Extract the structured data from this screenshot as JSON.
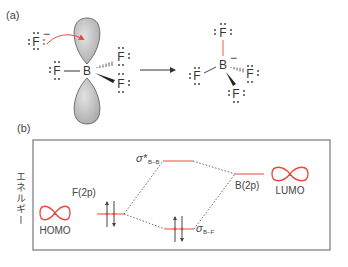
{
  "panel_a": {
    "label": "(a)",
    "reactant": {
      "central_atom": "B",
      "ligands": [
        "F",
        "F",
        "F"
      ],
      "nucleophile": "F",
      "nucleophile_charge": "−"
    },
    "product": {
      "central_atom": "B",
      "central_charge": "−",
      "ligands": [
        "F",
        "F",
        "F",
        "F"
      ]
    }
  },
  "panel_b": {
    "label": "(b)",
    "y_axis_label": "エネルギー",
    "levels": {
      "f2p": "F(2p)",
      "b2p": "B(2p)",
      "sigma_star": "σ*",
      "sigma_star_sub": "B−B",
      "sigma": "σ",
      "sigma_sub": "B−F"
    },
    "homo_label": "HOMO",
    "lumo_label": "LUMO"
  },
  "colors": {
    "accent_red": "#e8483c",
    "orbital_gray": "#c8c8c8",
    "line_dark": "#444444",
    "frame": "#777777"
  }
}
